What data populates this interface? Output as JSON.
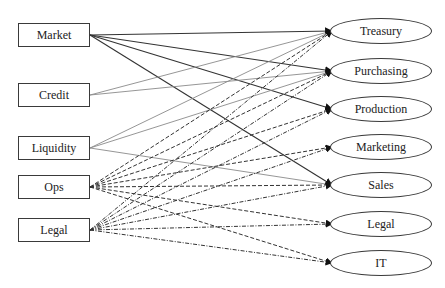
{
  "diagram": {
    "type": "bipartite-flow",
    "sources": [
      {
        "id": "market",
        "label": "Market",
        "x": 18,
        "y": 23,
        "style": "solid-dark"
      },
      {
        "id": "credit",
        "label": "Credit",
        "x": 18,
        "y": 83,
        "style": "solid-light"
      },
      {
        "id": "liquidity",
        "label": "Liquidity",
        "x": 18,
        "y": 136,
        "style": "solid-light"
      },
      {
        "id": "ops",
        "label": "Ops",
        "x": 18,
        "y": 175,
        "style": "dashed"
      },
      {
        "id": "legal_src",
        "label": "Legal",
        "x": 18,
        "y": 218,
        "style": "dashdot"
      }
    ],
    "targets": [
      {
        "id": "treasury",
        "label": "Treasury",
        "x": 330,
        "y": 18
      },
      {
        "id": "purchasing",
        "label": "Purchasing",
        "x": 330,
        "y": 58
      },
      {
        "id": "production",
        "label": "Production",
        "x": 330,
        "y": 96
      },
      {
        "id": "marketing",
        "label": "Marketing",
        "x": 330,
        "y": 134
      },
      {
        "id": "sales",
        "label": "Sales",
        "x": 330,
        "y": 172
      },
      {
        "id": "legal_tgt",
        "label": "Legal",
        "x": 330,
        "y": 211
      },
      {
        "id": "it",
        "label": "IT",
        "x": 330,
        "y": 250
      }
    ],
    "edges": [
      {
        "from": "market",
        "to": "treasury"
      },
      {
        "from": "market",
        "to": "purchasing"
      },
      {
        "from": "market",
        "to": "production"
      },
      {
        "from": "market",
        "to": "sales"
      },
      {
        "from": "credit",
        "to": "treasury"
      },
      {
        "from": "credit",
        "to": "purchasing"
      },
      {
        "from": "liquidity",
        "to": "treasury"
      },
      {
        "from": "liquidity",
        "to": "purchasing"
      },
      {
        "from": "liquidity",
        "to": "sales"
      },
      {
        "from": "ops",
        "to": "treasury"
      },
      {
        "from": "ops",
        "to": "purchasing"
      },
      {
        "from": "ops",
        "to": "production"
      },
      {
        "from": "ops",
        "to": "marketing"
      },
      {
        "from": "ops",
        "to": "sales"
      },
      {
        "from": "ops",
        "to": "legal_tgt"
      },
      {
        "from": "ops",
        "to": "it"
      },
      {
        "from": "legal_src",
        "to": "treasury"
      },
      {
        "from": "legal_src",
        "to": "purchasing"
      },
      {
        "from": "legal_src",
        "to": "production"
      },
      {
        "from": "legal_src",
        "to": "marketing"
      },
      {
        "from": "legal_src",
        "to": "sales"
      },
      {
        "from": "legal_src",
        "to": "legal_tgt"
      },
      {
        "from": "legal_src",
        "to": "it"
      }
    ],
    "styles": {
      "solid-dark": {
        "color": "#333333",
        "width": 1.1,
        "dash": ""
      },
      "solid-light": {
        "color": "#8a8a8a",
        "width": 0.9,
        "dash": ""
      },
      "dashed": {
        "color": "#333333",
        "width": 1.0,
        "dash": "4,2"
      },
      "dashdot": {
        "color": "#333333",
        "width": 1.0,
        "dash": "4,1.5,1,1.5"
      }
    }
  }
}
